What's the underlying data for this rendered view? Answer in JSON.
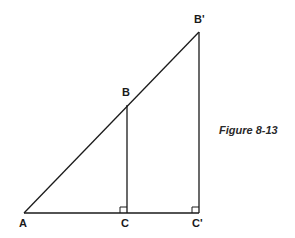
{
  "figure": {
    "caption": "Figure 8-13",
    "line_color": "#1a1a1a",
    "background": "#ffffff"
  },
  "points": {
    "A": {
      "label": "A",
      "x": 24,
      "y": 213
    },
    "B": {
      "label": "B",
      "x": 127,
      "y": 105
    },
    "C": {
      "label": "C",
      "x": 127,
      "y": 213
    },
    "B_prime": {
      "label": "B'",
      "x": 199,
      "y": 32
    },
    "C_prime": {
      "label": "C'",
      "x": 199,
      "y": 213
    }
  },
  "segments": [
    {
      "from": "A",
      "to": "B_prime",
      "name": "hypotenuse-AB'"
    },
    {
      "from": "A",
      "to": "C_prime",
      "name": "base-AC'"
    },
    {
      "from": "B",
      "to": "C",
      "name": "leg-BC"
    },
    {
      "from": "B_prime",
      "to": "C_prime",
      "name": "leg-B'C'"
    }
  ],
  "right_angles": [
    {
      "at": "C",
      "name": "right-angle-C"
    },
    {
      "at": "C_prime",
      "name": "right-angle-C'"
    }
  ]
}
